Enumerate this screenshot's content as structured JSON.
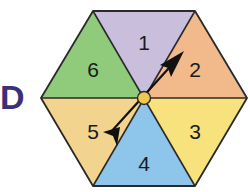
{
  "label": "D",
  "spinner": {
    "shape": "hexagon",
    "segments": [
      {
        "number": "1",
        "color": "#c9bfdc",
        "position": "top"
      },
      {
        "number": "2",
        "color": "#f2b98a",
        "position": "upper-right"
      },
      {
        "number": "3",
        "color": "#f7e27d",
        "position": "lower-right"
      },
      {
        "number": "4",
        "color": "#8ec5ea",
        "position": "bottom"
      },
      {
        "number": "5",
        "color": "#f2d48e",
        "position": "lower-left"
      },
      {
        "number": "6",
        "color": "#8fcb7a",
        "position": "upper-left"
      }
    ],
    "hub_color": "#f0c850",
    "arrow_points_to": "2",
    "outline_color": "#2a2a2a"
  }
}
